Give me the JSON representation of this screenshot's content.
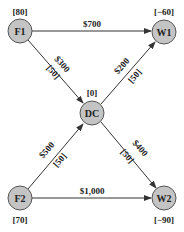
{
  "diagram": {
    "type": "network-flow",
    "colors": {
      "node_fill": "#c4c4c4",
      "node_stroke": "#555555",
      "edge": "#333333"
    },
    "nodes": [
      {
        "id": "F1",
        "label": "F1",
        "supply": "[80]"
      },
      {
        "id": "W1",
        "label": "W1",
        "supply": "[−60]"
      },
      {
        "id": "DC",
        "label": "DC",
        "supply": "[0]"
      },
      {
        "id": "F2",
        "label": "F2",
        "supply": "[70]"
      },
      {
        "id": "W2",
        "label": "W2",
        "supply": "[−90]"
      }
    ],
    "edges": [
      {
        "from": "F1",
        "to": "W1",
        "cost": "$700",
        "capacity": ""
      },
      {
        "from": "F1",
        "to": "DC",
        "cost": "$300",
        "capacity": "[50]"
      },
      {
        "from": "DC",
        "to": "W1",
        "cost": "$200",
        "capacity": "[50]"
      },
      {
        "from": "F2",
        "to": "DC",
        "cost": "$500",
        "capacity": "[50]"
      },
      {
        "from": "DC",
        "to": "W2",
        "cost": "$400",
        "capacity": "[50]"
      },
      {
        "from": "F2",
        "to": "W2",
        "cost": "$1,000",
        "capacity": ""
      }
    ]
  }
}
